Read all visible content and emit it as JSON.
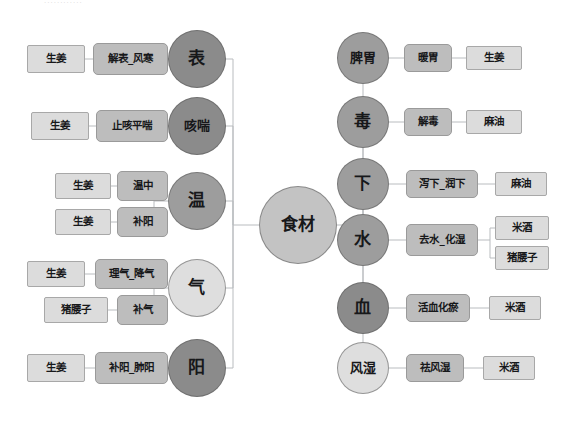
{
  "meta": {
    "canvas_width": 573,
    "canvas_height": 425,
    "background": "#ffffff",
    "top_caption": "············"
  },
  "palette": {
    "edge_stroke": "#b9bcbf",
    "circle_dark": "#8b8b8b",
    "circle_mid": "#9d9d9d",
    "circle_light": "#c9c9c9",
    "circle_lighter": "#dedede",
    "circle_center": "#c3c3c3",
    "box_effect": "#bdbdbd",
    "box_effect_light": "#c6c6c6",
    "box_ingredient": "#dcdcdc",
    "text": "#17181a"
  },
  "center": {
    "label": "食材",
    "x": 298,
    "y": 225,
    "d": 78,
    "fill": "#c3c3c3"
  },
  "left_branches": [
    {
      "category": "表",
      "cx": 197,
      "cy": 59,
      "d": 58,
      "fill": "#8b8b8b",
      "size": "cat-1",
      "effects": [
        {
          "label": "解表_风寒",
          "x": 93,
          "y": 43,
          "w": 75,
          "h": 32,
          "fill": "#bdbdbd",
          "ingredients": [
            {
              "label": "生姜",
              "x": 27,
              "y": 45,
              "w": 58,
              "h": 28,
              "fill": "#dcdcdc"
            }
          ]
        }
      ]
    },
    {
      "category": "咳喘",
      "cx": 197,
      "cy": 126,
      "d": 58,
      "fill": "#8b8b8b",
      "size": "cat-2",
      "effects": [
        {
          "label": "止咳平喘",
          "x": 96,
          "y": 110,
          "w": 72,
          "h": 32,
          "fill": "#bdbdbd",
          "ingredients": [
            {
              "label": "生姜",
              "x": 31,
              "y": 112,
              "w": 58,
              "h": 28,
              "fill": "#dcdcdc"
            }
          ]
        }
      ]
    },
    {
      "category": "温",
      "cx": 197,
      "cy": 201,
      "d": 58,
      "fill": "#9d9d9d",
      "size": "cat-1",
      "effects": [
        {
          "label": "温中",
          "x": 117,
          "y": 171,
          "w": 51,
          "h": 30,
          "fill": "#bdbdbd",
          "ingredients": [
            {
              "label": "生姜",
              "x": 55,
              "y": 173,
              "w": 56,
              "h": 26,
              "fill": "#dcdcdc"
            }
          ]
        },
        {
          "label": "补阳",
          "x": 117,
          "y": 207,
          "w": 51,
          "h": 30,
          "fill": "#bdbdbd",
          "ingredients": [
            {
              "label": "生姜",
              "x": 55,
              "y": 209,
              "w": 56,
              "h": 26,
              "fill": "#dcdcdc"
            }
          ]
        }
      ]
    },
    {
      "category": "气",
      "cx": 197,
      "cy": 288,
      "d": 58,
      "fill": "#dedede",
      "size": "cat-1",
      "effects": [
        {
          "label": "理气_降气",
          "x": 95,
          "y": 259,
          "w": 73,
          "h": 30,
          "fill": "#bdbdbd",
          "ingredients": [
            {
              "label": "生姜",
              "x": 27,
              "y": 261,
              "w": 58,
              "h": 26,
              "fill": "#dcdcdc"
            }
          ]
        },
        {
          "label": "补气",
          "x": 117,
          "y": 295,
          "w": 51,
          "h": 30,
          "fill": "#bdbdbd",
          "ingredients": [
            {
              "label": "猪腰子",
              "x": 44,
              "y": 297,
              "w": 64,
              "h": 26,
              "fill": "#dcdcdc"
            }
          ]
        }
      ]
    },
    {
      "category": "阳",
      "cx": 197,
      "cy": 368,
      "d": 58,
      "fill": "#8b8b8b",
      "size": "cat-1",
      "effects": [
        {
          "label": "补阳_肺阳",
          "x": 95,
          "y": 352,
          "w": 73,
          "h": 32,
          "fill": "#bdbdbd",
          "ingredients": [
            {
              "label": "生姜",
              "x": 27,
              "y": 354,
              "w": 58,
              "h": 28,
              "fill": "#dcdcdc"
            }
          ]
        }
      ]
    }
  ],
  "right_branches": [
    {
      "category": "脾胃",
      "cx": 363,
      "cy": 58,
      "d": 52,
      "fill": "#9d9d9d",
      "size": "cat-2",
      "effects": [
        {
          "label": "暖胃",
          "x": 404,
          "y": 44,
          "w": 48,
          "h": 28,
          "fill": "#bdbdbd",
          "ingredients": [
            {
              "label": "生姜",
              "x": 466,
              "y": 46,
              "w": 56,
              "h": 24,
              "fill": "#dcdcdc"
            }
          ]
        }
      ]
    },
    {
      "category": "毒",
      "cx": 363,
      "cy": 122,
      "d": 52,
      "fill": "#9d9d9d",
      "size": "cat-1",
      "effects": [
        {
          "label": "解毒",
          "x": 404,
          "y": 108,
          "w": 48,
          "h": 28,
          "fill": "#bdbdbd",
          "ingredients": [
            {
              "label": "麻油",
              "x": 466,
              "y": 110,
              "w": 56,
              "h": 24,
              "fill": "#dcdcdc"
            }
          ]
        }
      ]
    },
    {
      "category": "下",
      "cx": 363,
      "cy": 184,
      "d": 52,
      "fill": "#9d9d9d",
      "size": "cat-1",
      "effects": [
        {
          "label": "泻下_润下",
          "x": 406,
          "y": 170,
          "w": 72,
          "h": 28,
          "fill": "#bdbdbd",
          "ingredients": [
            {
              "label": "麻油",
              "x": 495,
              "y": 172,
              "w": 52,
              "h": 24,
              "fill": "#dcdcdc"
            }
          ]
        }
      ]
    },
    {
      "category": "水",
      "cx": 363,
      "cy": 240,
      "d": 52,
      "fill": "#9d9d9d",
      "size": "cat-1",
      "effects": [
        {
          "label": "去水_化湿",
          "x": 406,
          "y": 224,
          "w": 72,
          "h": 32,
          "fill": "#bdbdbd",
          "ingredients": [
            {
              "label": "米酒",
              "x": 495,
              "y": 216,
              "w": 54,
              "h": 24,
              "fill": "#dcdcdc"
            },
            {
              "label": "猪腰子",
              "x": 495,
              "y": 246,
              "w": 54,
              "h": 24,
              "fill": "#dcdcdc"
            }
          ]
        }
      ]
    },
    {
      "category": "血",
      "cx": 363,
      "cy": 308,
      "d": 52,
      "fill": "#8b8b8b",
      "size": "cat-1",
      "effects": [
        {
          "label": "活血化瘀",
          "x": 406,
          "y": 294,
          "w": 64,
          "h": 28,
          "fill": "#bdbdbd",
          "ingredients": [
            {
              "label": "米酒",
              "x": 489,
              "y": 296,
              "w": 52,
              "h": 24,
              "fill": "#dcdcdc"
            }
          ]
        }
      ]
    },
    {
      "category": "风湿",
      "cx": 363,
      "cy": 368,
      "d": 52,
      "fill": "#dedede",
      "size": "cat-2",
      "effects": [
        {
          "label": "祛风湿",
          "x": 406,
          "y": 354,
          "w": 58,
          "h": 28,
          "fill": "#bdbdbd",
          "ingredients": [
            {
              "label": "米酒",
              "x": 483,
              "y": 356,
              "w": 52,
              "h": 24,
              "fill": "#dcdcdc"
            }
          ]
        }
      ]
    }
  ]
}
